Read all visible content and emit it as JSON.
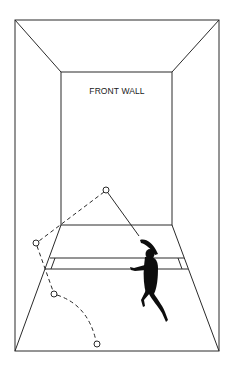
{
  "diagram": {
    "front_wall_label": "FRONT WALL",
    "colors": {
      "line": "#2a2a2a",
      "player": "#0d0d0d",
      "background": "#ffffff"
    },
    "ball_path": {
      "points": [
        {
          "x": 106,
          "y": 190,
          "name": "front-wall-contact"
        },
        {
          "x": 36,
          "y": 243,
          "name": "side-wall-contact"
        },
        {
          "x": 54,
          "y": 294,
          "name": "floor-bounce"
        },
        {
          "x": 97,
          "y": 344,
          "name": "ball-end"
        }
      ],
      "shot_line_style": "solid",
      "rebound_line_style": "dashed"
    }
  }
}
